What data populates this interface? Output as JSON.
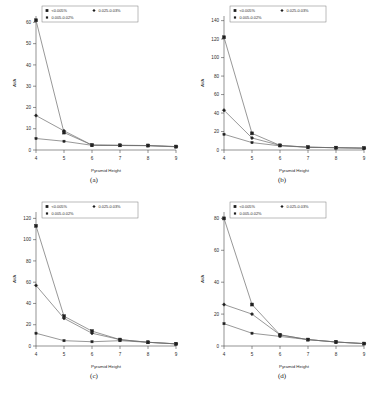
{
  "figure": {
    "panels": [
      {
        "caption": "(a)",
        "xlabel": "Pyramid Height",
        "ylabel": "AVA",
        "xticks": [
          "4",
          "5",
          "6",
          "7",
          "8",
          "9"
        ],
        "yticks": [
          "0",
          "10",
          "20",
          "30",
          "40",
          "50",
          "60"
        ],
        "ymax": 63
      },
      {
        "caption": "(b)",
        "xlabel": "Pyramid Height",
        "ylabel": "AVA",
        "xticks": [
          "4",
          "5",
          "6",
          "7",
          "8",
          "9"
        ],
        "yticks": [
          "0",
          "20",
          "40",
          "60",
          "80",
          "100",
          "120",
          "140"
        ],
        "ymax": 145
      },
      {
        "caption": "(c)",
        "xlabel": "Pyramid Height",
        "ylabel": "AVA",
        "xticks": [
          "4",
          "5",
          "6",
          "7",
          "8",
          "9"
        ],
        "yticks": [
          "0",
          "20",
          "40",
          "60",
          "80",
          "100",
          "120"
        ],
        "ymax": 126
      },
      {
        "caption": "(d)",
        "xlabel": "Pyramid Height",
        "ylabel": "AVA",
        "xticks": [
          "4",
          "5",
          "6",
          "7",
          "8",
          "9"
        ],
        "yticks": [
          "0",
          "20",
          "40",
          "60",
          "80"
        ],
        "ymax": 84
      }
    ],
    "legend": {
      "entry1": "<0.005%",
      "entry2": "0.025-0.03%",
      "entry3": "0.005-0.02%"
    }
  },
  "chart_data": [
    {
      "type": "line",
      "title": "(a)",
      "xlabel": "Pyramid Height",
      "ylabel": "AVA",
      "x": [
        4,
        5,
        6,
        7,
        8,
        9
      ],
      "xlim": [
        4,
        9
      ],
      "ylim": [
        0,
        63
      ],
      "grid": false,
      "legend_position": "top-left",
      "series": [
        {
          "name": "<0.005%",
          "values": [
            61,
            8.2,
            2.3,
            2.2,
            2.1,
            1.6
          ]
        },
        {
          "name": "0.025-0.03%",
          "values": [
            16.2,
            9.0,
            2.3,
            2.2,
            2.1,
            1.6
          ]
        },
        {
          "name": "0.005-0.02%",
          "values": [
            5.4,
            4.1,
            2.2,
            2.1,
            2.0,
            1.5
          ]
        }
      ]
    },
    {
      "type": "line",
      "title": "(b)",
      "xlabel": "Pyramid Height",
      "ylabel": "AVA",
      "x": [
        4,
        5,
        6,
        7,
        8,
        9
      ],
      "xlim": [
        4,
        9
      ],
      "ylim": [
        0,
        145
      ],
      "grid": false,
      "legend_position": "top-left",
      "series": [
        {
          "name": "<0.005%",
          "values": [
            122,
            18,
            5,
            3,
            2.5,
            2
          ]
        },
        {
          "name": "0.025-0.03%",
          "values": [
            43,
            13,
            5,
            3,
            2.5,
            2
          ]
        },
        {
          "name": "0.005-0.02%",
          "values": [
            17,
            8,
            4.5,
            3,
            2.5,
            2
          ]
        }
      ]
    },
    {
      "type": "line",
      "title": "(c)",
      "xlabel": "Pyramid Height",
      "ylabel": "AVA",
      "x": [
        4,
        5,
        6,
        7,
        8,
        9
      ],
      "xlim": [
        4,
        9
      ],
      "ylim": [
        0,
        126
      ],
      "grid": false,
      "legend_position": "top-left",
      "series": [
        {
          "name": "<0.005%",
          "values": [
            113,
            28,
            14,
            6,
            3.5,
            2
          ]
        },
        {
          "name": "0.025-0.03%",
          "values": [
            57,
            26,
            12,
            6,
            3.5,
            2
          ]
        },
        {
          "name": "0.005-0.02%",
          "values": [
            12,
            5,
            4,
            5,
            3.5,
            2
          ]
        }
      ]
    },
    {
      "type": "line",
      "title": "(d)",
      "xlabel": "Pyramid Height",
      "ylabel": "AVA",
      "x": [
        4,
        5,
        6,
        7,
        8,
        9
      ],
      "xlim": [
        4,
        9
      ],
      "ylim": [
        0,
        84
      ],
      "grid": false,
      "legend_position": "top-left",
      "series": [
        {
          "name": "<0.005%",
          "values": [
            80,
            26,
            7,
            4,
            2.5,
            1.5
          ]
        },
        {
          "name": "0.025-0.03%",
          "values": [
            26,
            20,
            7,
            4,
            2.5,
            1.5
          ]
        },
        {
          "name": "0.005-0.02%",
          "values": [
            14,
            8,
            6,
            4,
            2.5,
            1.5
          ]
        }
      ]
    }
  ]
}
